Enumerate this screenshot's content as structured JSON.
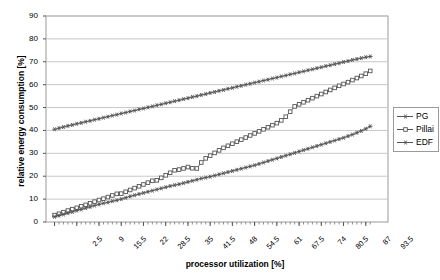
{
  "chart_data": {
    "type": "line",
    "title": "",
    "xlabel": "processor utilization [%]",
    "ylabel": "relative energy consumption [%]",
    "xlim": [
      0,
      100
    ],
    "ylim": [
      0,
      90
    ],
    "ytick_labels": [
      "0",
      "10",
      "20",
      "30",
      "40",
      "50",
      "60",
      "70",
      "80",
      "90"
    ],
    "ytick_values": [
      0,
      10,
      20,
      30,
      40,
      50,
      60,
      70,
      80,
      90
    ],
    "xtick_labels": [
      "2.5",
      "9",
      "15.5",
      "22",
      "28.5",
      "35",
      "41.5",
      "48",
      "54.5",
      "61",
      "67.5",
      "74",
      "80.5",
      "87",
      "93.5"
    ],
    "xtick_values": [
      2.5,
      9,
      15.5,
      22,
      28.5,
      35,
      41.5,
      48,
      54.5,
      61,
      67.5,
      74,
      80.5,
      87,
      93.5
    ],
    "grid": "horizontal",
    "legend_position": "right",
    "x": [
      2.5,
      3.8,
      5.1,
      6.4,
      7.7,
      9,
      10.3,
      11.6,
      12.9,
      14.2,
      15.5,
      16.8,
      18.1,
      19.4,
      20.7,
      22,
      23.3,
      24.6,
      25.9,
      27.2,
      28.5,
      29.8,
      31.1,
      32.4,
      33.7,
      35,
      36.3,
      37.6,
      38.9,
      40.2,
      41.5,
      42.8,
      44.1,
      45.4,
      46.7,
      48,
      49.3,
      50.6,
      51.9,
      53.2,
      54.5,
      55.8,
      57.1,
      58.4,
      59.7,
      61,
      62.3,
      63.6,
      64.9,
      66.2,
      67.5,
      68.8,
      70.1,
      71.4,
      72.7,
      74,
      75.3,
      76.6,
      77.9,
      79.2,
      80.5,
      81.8,
      83.1,
      84.4,
      85.7,
      87,
      88.3,
      89.6,
      90.9,
      92.2,
      93.5,
      94.8
    ],
    "series": [
      {
        "name": "EDF",
        "color": "#555555",
        "marker": "star",
        "values": [
          40.5,
          41.0,
          41.5,
          42.0,
          42.4,
          42.9,
          43.3,
          43.8,
          44.2,
          44.7,
          45.1,
          45.6,
          46.0,
          46.5,
          46.9,
          47.4,
          47.8,
          48.3,
          48.7,
          49.2,
          49.6,
          50.1,
          50.5,
          51.0,
          51.4,
          51.9,
          52.3,
          52.8,
          53.2,
          53.7,
          54.1,
          54.6,
          55.0,
          55.5,
          55.9,
          56.4,
          56.8,
          57.3,
          57.7,
          58.2,
          58.6,
          59.1,
          59.5,
          60.0,
          60.4,
          60.9,
          61.3,
          61.8,
          62.2,
          62.7,
          63.1,
          63.6,
          64.0,
          64.5,
          64.9,
          65.4,
          65.8,
          66.3,
          66.7,
          67.2,
          67.6,
          68.1,
          68.5,
          69.0,
          69.4,
          69.9,
          70.3,
          70.8,
          71.2,
          71.6,
          72.0,
          72.3
        ]
      },
      {
        "name": "Pillai",
        "color": "#555555",
        "marker": "square",
        "values": [
          3.0,
          3.6,
          4.3,
          5.0,
          5.6,
          6.2,
          6.9,
          7.5,
          8.2,
          8.9,
          9.6,
          10.2,
          10.9,
          11.6,
          12.3,
          12.4,
          13.2,
          14.0,
          14.8,
          15.6,
          16.4,
          17.2,
          18.0,
          18.2,
          19.3,
          20.4,
          21.5,
          22.6,
          22.9,
          23.4,
          24.0,
          23.5,
          23.4,
          26.0,
          27.8,
          29.0,
          30.2,
          31.3,
          32.4,
          33.3,
          34.2,
          35.1,
          36.0,
          36.9,
          37.8,
          38.7,
          39.6,
          40.5,
          41.4,
          42.3,
          43.2,
          44.4,
          46.0,
          48.2,
          50.5,
          51.4,
          52.3,
          53.2,
          54.1,
          55.0,
          55.9,
          56.8,
          57.7,
          58.6,
          59.5,
          60.3,
          61.1,
          62.0,
          62.9,
          63.8,
          64.8,
          66.0
        ]
      },
      {
        "name": "PG",
        "color": "#555555",
        "marker": "star",
        "values": [
          2.3,
          2.8,
          3.3,
          3.9,
          4.4,
          5.0,
          5.5,
          6.1,
          6.6,
          7.2,
          7.7,
          8.2,
          8.6,
          9.1,
          9.5,
          10.0,
          10.6,
          11.2,
          11.7,
          12.2,
          12.7,
          13.2,
          13.7,
          14.2,
          14.7,
          15.2,
          15.7,
          16.1,
          16.5,
          17.0,
          17.5,
          18.0,
          18.5,
          19.0,
          19.4,
          19.8,
          20.3,
          20.8,
          21.3,
          21.8,
          22.3,
          22.8,
          23.3,
          23.8,
          24.3,
          24.8,
          25.4,
          26.0,
          26.6,
          27.2,
          27.8,
          28.4,
          29.0,
          29.6,
          30.2,
          30.8,
          31.4,
          32.0,
          32.6,
          33.2,
          33.8,
          34.4,
          35.0,
          35.6,
          36.2,
          36.8,
          37.5,
          38.2,
          39.0,
          39.8,
          40.7,
          41.8
        ]
      }
    ]
  },
  "legend": {
    "entries": [
      {
        "label": "PG"
      },
      {
        "label": "Pillai"
      },
      {
        "label": "EDF"
      }
    ]
  }
}
